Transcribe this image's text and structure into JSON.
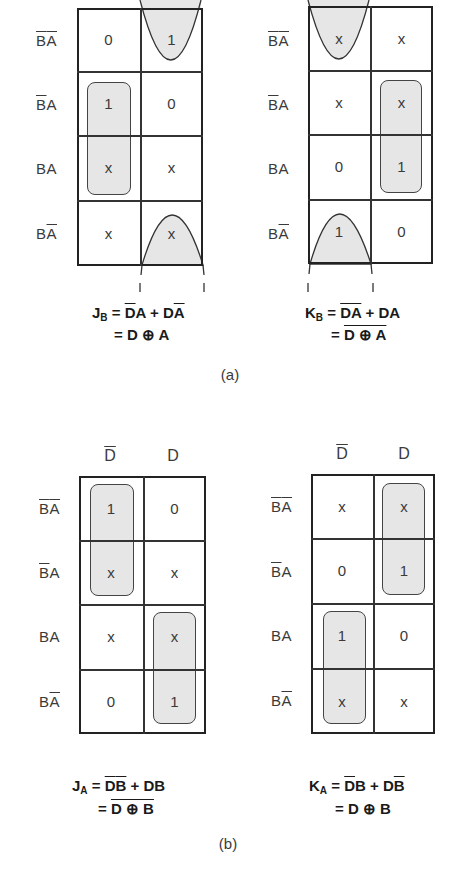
{
  "figure": {
    "part_a": {
      "caption": "(a)",
      "row_labels": [
        {
          "b": "B",
          "b_bar": true,
          "a": "A",
          "a_bar": true
        },
        {
          "b": "B",
          "b_bar": true,
          "a": "A",
          "a_bar": false
        },
        {
          "b": "B",
          "b_bar": false,
          "a": "A",
          "a_bar": false
        },
        {
          "b": "B",
          "b_bar": false,
          "a": "A",
          "a_bar": true
        }
      ],
      "maps": [
        {
          "name": "JB",
          "cells": [
            [
              "0",
              "1"
            ],
            [
              "1",
              "0"
            ],
            [
              "x",
              "x"
            ],
            [
              "x",
              "x"
            ]
          ],
          "equation": {
            "lhs": "J",
            "lhs_sub": "B",
            "line1_terms": [
              {
                "t": "D",
                "bar": true
              },
              {
                "t": "A",
                "bar": false
              },
              {
                "op": "+"
              },
              {
                "t": "D",
                "bar": false
              },
              {
                "t": "A",
                "bar": true
              }
            ],
            "line1_text": "J_B = D̄A + DĀ",
            "line2_text": "= D ⊕ A",
            "line2_overbar": false
          }
        },
        {
          "name": "KB",
          "cells": [
            [
              "x",
              "x"
            ],
            [
              "x",
              "x"
            ],
            [
              "0",
              "1"
            ],
            [
              "1",
              "0"
            ]
          ],
          "equation": {
            "lhs": "K",
            "lhs_sub": "B",
            "line1_text": "K_B = D̄Ā + DA",
            "line2_text": "= D ⊕ A",
            "line2_overbar": true
          }
        }
      ]
    },
    "part_b": {
      "caption": "(b)",
      "col_labels": [
        {
          "t": "D",
          "bar": true
        },
        {
          "t": "D",
          "bar": false
        }
      ],
      "maps": [
        {
          "name": "JA",
          "cells": [
            [
              "1",
              "0"
            ],
            [
              "x",
              "x"
            ],
            [
              "x",
              "x"
            ],
            [
              "0",
              "1"
            ]
          ],
          "equation": {
            "lhs": "J",
            "lhs_sub": "A",
            "line1_text": "J_A = D̄B̄ + DB",
            "line2_text": "= D ⊕ B",
            "line2_overbar": true
          }
        },
        {
          "name": "KA",
          "cells": [
            [
              "x",
              "x"
            ],
            [
              "0",
              "1"
            ],
            [
              "1",
              "0"
            ],
            [
              "x",
              "x"
            ]
          ],
          "equation": {
            "lhs": "K",
            "lhs_sub": "A",
            "line1_text": "K_A = D̄B + DB̄",
            "line2_text": "= D ⊕ B",
            "line2_overbar": false
          }
        }
      ]
    },
    "labels": {
      "BA_00": "BA",
      "BA_01": "BA",
      "BA_11": "BA",
      "BA_10": "BA",
      "D": "D",
      "Dbar": "D",
      "plus": "+",
      "eq": "=",
      "xor": "⊕",
      "J": "J",
      "K": "K",
      "A": "A",
      "B": "B"
    },
    "colors": {
      "loop_fill": "#e6e6e6",
      "line": "#222222",
      "text": "#3a3a3a"
    }
  }
}
